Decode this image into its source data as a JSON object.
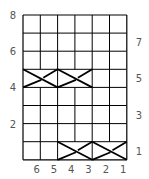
{
  "chart": {
    "columns": 6,
    "rows": 8,
    "grid": {
      "left": 23,
      "top": 15,
      "cell_w": 17.3,
      "cell_h": 18.1
    },
    "line_color": "#000000",
    "label_color": "#555555",
    "left_row_labels": [
      {
        "row": 8,
        "text": "8"
      },
      {
        "row": 6,
        "text": "6"
      },
      {
        "row": 4,
        "text": "4"
      },
      {
        "row": 2,
        "text": "2"
      }
    ],
    "right_row_labels": [
      {
        "row": 7,
        "text": "7"
      },
      {
        "row": 5,
        "text": "5"
      },
      {
        "row": 3,
        "text": "3"
      },
      {
        "row": 1,
        "text": "1"
      }
    ],
    "column_labels": [
      "6",
      "5",
      "4",
      "3",
      "2",
      "1"
    ],
    "cables": [
      {
        "row": 5,
        "from_col": 6,
        "to_col": 5,
        "type": "cross"
      },
      {
        "row": 5,
        "from_col": 4,
        "to_col": 3,
        "type": "cross"
      },
      {
        "row": 1,
        "from_col": 4,
        "to_col": 3,
        "type": "cross"
      },
      {
        "row": 1,
        "from_col": 2,
        "to_col": 1,
        "type": "cross"
      }
    ]
  }
}
